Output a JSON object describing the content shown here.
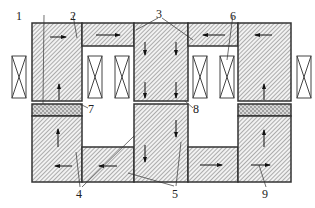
{
  "diagram": {
    "type": "magnetic-core-cross-section",
    "labels": [
      {
        "id": "1",
        "text": "1",
        "x": 16,
        "y": 10
      },
      {
        "id": "2",
        "text": "2",
        "x": 70,
        "y": 10
      },
      {
        "id": "3",
        "text": "3",
        "x": 157,
        "y": 9
      },
      {
        "id": "4",
        "text": "4",
        "x": 76,
        "y": 190
      },
      {
        "id": "5",
        "text": "5",
        "x": 173,
        "y": 190
      },
      {
        "id": "6",
        "text": "6",
        "x": 230,
        "y": 10
      },
      {
        "id": "7",
        "text": "7",
        "x": 88,
        "y": 103
      },
      {
        "id": "8",
        "text": "8",
        "x": 193,
        "y": 103
      },
      {
        "id": "9",
        "text": "9",
        "x": 263,
        "y": 190
      }
    ],
    "colors": {
      "outline": "#333333",
      "hatch": "#555555",
      "fill": "#f4f4f4",
      "dotted_band": "#bfbfbf"
    },
    "components": {
      "core_blocks": [
        "left-upper",
        "left-lower",
        "center-upper",
        "center-lower",
        "right-upper",
        "right-lower"
      ],
      "bridges": [
        "upper-left-bridge",
        "upper-right-bridge",
        "lower-left-bridge",
        "lower-right-bridge"
      ],
      "coils": 6,
      "magnet_bands": 2
    }
  }
}
